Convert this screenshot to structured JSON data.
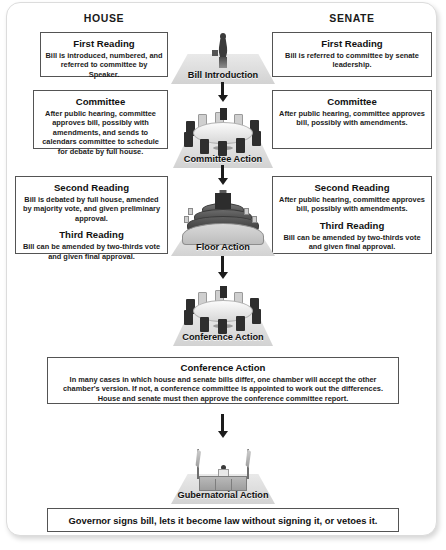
{
  "diagram": {
    "columns": {
      "left": "HOUSE",
      "right": "SENATE"
    },
    "accent_border": "#545454",
    "stage_fill": "#dddddd"
  },
  "house": {
    "first_reading": {
      "title": "First Reading",
      "body": "Bill is introduced, numbered, and referred to committee by Speaker."
    },
    "committee": {
      "title": "Committee",
      "body": "After public hearing, committee approves bill, possibly with amendments, and sends to calendars committee to schedule for debate by full house."
    },
    "second_reading": {
      "title": "Second Reading",
      "body": "Bill is debated by full house, amended by majority vote, and given preliminary approval."
    },
    "third_reading": {
      "title": "Third Reading",
      "body": "Bill can be amended by two-thirds vote and given final approval."
    }
  },
  "senate": {
    "first_reading": {
      "title": "First Reading",
      "body": "Bill is referred to committee by senate leadership."
    },
    "committee": {
      "title": "Committee",
      "body": "After public hearing, committee approves bill, possibly with amendments."
    },
    "second_reading": {
      "title": "Second Reading",
      "body": "After public hearing, committee approves bill, possibly with amendments."
    },
    "third_reading": {
      "title": "Third Reading",
      "body": "Bill can be amended by two-thirds vote and given final approval."
    }
  },
  "stages": {
    "bill_introduction": "Bill Introduction",
    "committee_action": "Committee Action",
    "floor_action": "Floor Action",
    "conference_action": "Conference Action",
    "gubernatorial_action": "Gubernatorial Action"
  },
  "conference": {
    "title": "Conference Action",
    "body": "In many cases in which house and senate bills differ, one chamber will accept the other chamber's version. If not, a conference committee is appointed to work out the differences. House and senate must then approve the conference committee report."
  },
  "governor": {
    "text": "Governor signs bill, lets it become law without signing it, or vetoes it."
  }
}
